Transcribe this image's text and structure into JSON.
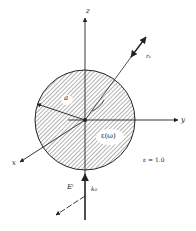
{
  "diagram": {
    "axes": {
      "z_label": "z",
      "y_label": "y",
      "x_label": "x"
    },
    "sphere": {
      "radius_label": "a",
      "permittivity_label": "ε(ω)",
      "hatch": true
    },
    "surrounding_medium_label": "ε = 1.0",
    "scattered_direction_label": "rₛ",
    "incident": {
      "field_label": "Eⁱ",
      "wavevector_label": "k₀"
    },
    "colors": {
      "line": "#222222",
      "hatch": "#555555",
      "background": "#ffffff"
    }
  }
}
